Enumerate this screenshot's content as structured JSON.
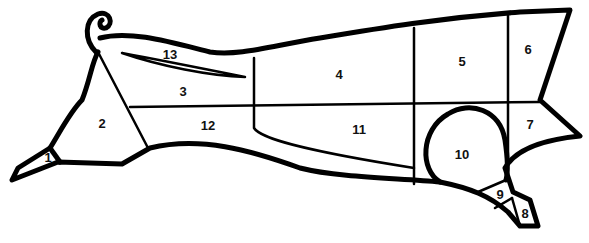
{
  "diagram": {
    "type": "cut-chart",
    "stroke_color": "#000000",
    "background": "#ffffff",
    "regions": [
      {
        "id": "1",
        "label": "1"
      },
      {
        "id": "2",
        "label": "2"
      },
      {
        "id": "3",
        "label": "3"
      },
      {
        "id": "4",
        "label": "4"
      },
      {
        "id": "5",
        "label": "5"
      },
      {
        "id": "6",
        "label": "6"
      },
      {
        "id": "7",
        "label": "7"
      },
      {
        "id": "8",
        "label": "8"
      },
      {
        "id": "9",
        "label": "9"
      },
      {
        "id": "10",
        "label": "10"
      },
      {
        "id": "11",
        "label": "11"
      },
      {
        "id": "12",
        "label": "12"
      },
      {
        "id": "13",
        "label": "13"
      }
    ]
  }
}
